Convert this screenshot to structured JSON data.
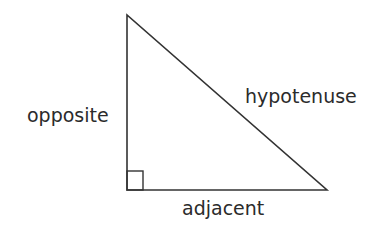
{
  "diagram": {
    "labels": {
      "opposite": "opposite",
      "hypotenuse": "hypotenuse",
      "adjacent": "adjacent"
    },
    "colors": {
      "stroke": "#333333",
      "text": "#2b2b2b",
      "background": "#ffffff"
    }
  }
}
